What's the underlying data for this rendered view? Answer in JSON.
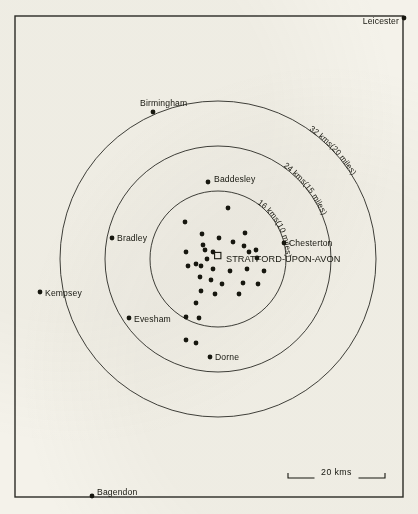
{
  "map": {
    "title": "Stratford-upon-Avon distance-ring distribution map",
    "background_color": "#f4f2ea",
    "ink_color": "#17170f",
    "frame": {
      "x": 15,
      "y": 16,
      "width": 388,
      "height": 481
    },
    "centre": {
      "label": "STRATFORD-UPON-AVON",
      "marker": "open-square",
      "x": 218,
      "y": 259,
      "label_x": 226,
      "label_y": 262
    },
    "rings": [
      {
        "label": "16 kms(10 miles)",
        "radius": 68,
        "label_angle_deg": -38
      },
      {
        "label": "24 kms(15 miles)",
        "radius": 113,
        "label_angle_deg": -38
      },
      {
        "label": "32 kms(20 miles)",
        "radius": 158,
        "label_angle_deg": -38
      }
    ],
    "places": [
      {
        "name": "Leicester",
        "dot_x": 404,
        "dot_y": 18,
        "label_x": 399,
        "label_y": 24,
        "anchor": "end"
      },
      {
        "name": "Birmingham",
        "dot_x": 153,
        "dot_y": 112,
        "label_x": 140,
        "label_y": 106,
        "anchor": "start"
      },
      {
        "name": "Baddesley",
        "dot_x": 208,
        "dot_y": 182,
        "label_x": 214,
        "label_y": 182,
        "anchor": "start"
      },
      {
        "name": "Bradley",
        "dot_x": 112,
        "dot_y": 238,
        "label_x": 117,
        "label_y": 241,
        "anchor": "start"
      },
      {
        "name": "Chesterton",
        "dot_x": 284,
        "dot_y": 243,
        "label_x": 289,
        "label_y": 246,
        "anchor": "start"
      },
      {
        "name": "Kempsey",
        "dot_x": 40,
        "dot_y": 292,
        "label_x": 45,
        "label_y": 296,
        "anchor": "start"
      },
      {
        "name": "Evesham",
        "dot_x": 129,
        "dot_y": 318,
        "label_x": 134,
        "label_y": 322,
        "anchor": "start"
      },
      {
        "name": "Dorne",
        "dot_x": 210,
        "dot_y": 357,
        "label_x": 215,
        "label_y": 360,
        "anchor": "start"
      },
      {
        "name": "Bagendon",
        "dot_x": 92,
        "dot_y": 496,
        "label_x": 97,
        "label_y": 495,
        "anchor": "start"
      }
    ],
    "site_dots": [
      {
        "x": 228,
        "y": 208
      },
      {
        "x": 185,
        "y": 222
      },
      {
        "x": 202,
        "y": 234
      },
      {
        "x": 219,
        "y": 238
      },
      {
        "x": 245,
        "y": 233
      },
      {
        "x": 203,
        "y": 245
      },
      {
        "x": 233,
        "y": 242
      },
      {
        "x": 244,
        "y": 246
      },
      {
        "x": 186,
        "y": 252
      },
      {
        "x": 205,
        "y": 250
      },
      {
        "x": 213,
        "y": 252
      },
      {
        "x": 249,
        "y": 252
      },
      {
        "x": 256,
        "y": 250
      },
      {
        "x": 207,
        "y": 259
      },
      {
        "x": 257,
        "y": 258
      },
      {
        "x": 188,
        "y": 266
      },
      {
        "x": 196,
        "y": 264
      },
      {
        "x": 201,
        "y": 266
      },
      {
        "x": 213,
        "y": 269
      },
      {
        "x": 230,
        "y": 271
      },
      {
        "x": 247,
        "y": 269
      },
      {
        "x": 264,
        "y": 271
      },
      {
        "x": 200,
        "y": 277
      },
      {
        "x": 211,
        "y": 280
      },
      {
        "x": 222,
        "y": 284
      },
      {
        "x": 243,
        "y": 283
      },
      {
        "x": 258,
        "y": 284
      },
      {
        "x": 201,
        "y": 291
      },
      {
        "x": 215,
        "y": 294
      },
      {
        "x": 239,
        "y": 294
      },
      {
        "x": 196,
        "y": 303
      },
      {
        "x": 186,
        "y": 317
      },
      {
        "x": 199,
        "y": 318
      },
      {
        "x": 186,
        "y": 340
      },
      {
        "x": 196,
        "y": 343
      }
    ],
    "scale_bar": {
      "label": "20 kms",
      "x1": 288,
      "x2": 385,
      "y": 478,
      "tick_height": 5
    }
  }
}
